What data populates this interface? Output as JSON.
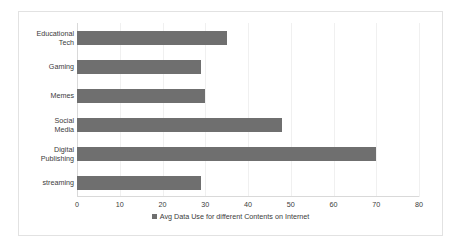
{
  "chart_data": {
    "type": "bar",
    "orientation": "horizontal",
    "title": "",
    "xlabel": "",
    "ylabel": "",
    "categories": [
      "Educational Tech",
      "Gaming",
      "Memes",
      "Social Media",
      "Digital Publishing",
      "streaming"
    ],
    "category_labels_wrapped": [
      "Educational\nTech",
      "Gaming",
      "Memes",
      "Social\nMedia",
      "Digital\nPublishing",
      "streaming"
    ],
    "values": [
      35,
      29,
      30,
      48,
      70,
      29
    ],
    "series": [
      {
        "name": "Avg Data Use for different Contents on Internet",
        "values": [
          35,
          29,
          30,
          48,
          70,
          29
        ]
      }
    ],
    "xlim": [
      0,
      80
    ],
    "xticks": [
      0,
      10,
      20,
      30,
      40,
      50,
      60,
      70,
      80
    ],
    "xtick_labels": [
      "0",
      "10",
      "20",
      "30",
      "40",
      "50",
      "60",
      "70",
      "80"
    ],
    "grid": true,
    "legend": {
      "position": "bottom",
      "entries": [
        {
          "label": "Avg Data Use for different Contents on Internet",
          "color": "#6f6f6f"
        }
      ]
    },
    "colors": {
      "bar": "#6f6f6f",
      "axis": "#d9d9d9",
      "grid": "#f0f0f0",
      "text": "#3b3b3b",
      "frame": "#e2e2e2",
      "background": "#ffffff"
    }
  }
}
